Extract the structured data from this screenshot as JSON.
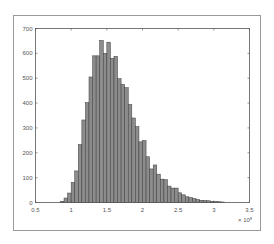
{
  "chart_data": {
    "type": "bar",
    "subtype": "histogram",
    "title": "",
    "xlabel": "",
    "ylabel": "",
    "x_exponent_label": "× 10^8",
    "xlim": [
      0.5,
      3.5
    ],
    "ylim": [
      0,
      700
    ],
    "xticks": [
      0.5,
      1,
      1.5,
      2,
      2.5,
      3,
      3.5
    ],
    "xtick_labels": [
      "0.5",
      "1",
      "1.5",
      "2",
      "2.5",
      "3",
      "3.5"
    ],
    "yticks": [
      0,
      100,
      200,
      300,
      400,
      500,
      600,
      700
    ],
    "ytick_labels": [
      "0",
      "100",
      "200",
      "300",
      "400",
      "500",
      "600",
      "700"
    ],
    "grid": false,
    "legend": null,
    "bin_width": 0.05,
    "bin_starts": [
      0.85,
      0.9,
      0.95,
      1.0,
      1.05,
      1.1,
      1.15,
      1.2,
      1.25,
      1.3,
      1.35,
      1.4,
      1.45,
      1.5,
      1.55,
      1.6,
      1.65,
      1.7,
      1.75,
      1.8,
      1.85,
      1.9,
      1.95,
      2.0,
      2.05,
      2.1,
      2.15,
      2.2,
      2.25,
      2.3,
      2.35,
      2.4,
      2.45,
      2.5,
      2.55,
      2.6,
      2.65,
      2.7,
      2.75,
      2.8,
      2.85,
      2.9,
      2.95,
      3.0,
      3.05,
      3.1
    ],
    "values": [
      5,
      18,
      38,
      81,
      127,
      233,
      332,
      402,
      505,
      590,
      590,
      652,
      600,
      645,
      580,
      588,
      498,
      475,
      462,
      394,
      340,
      305,
      244,
      249,
      184,
      135,
      151,
      114,
      94,
      92,
      66,
      58,
      58,
      39,
      31,
      23,
      20,
      16,
      12,
      9,
      8,
      7,
      5,
      4,
      3,
      2
    ],
    "colors": {
      "bar_fill": "#8c8c8c",
      "bar_edge": "#3a3a3a",
      "axes": "#444444",
      "frame": "#9a9a9a"
    }
  }
}
